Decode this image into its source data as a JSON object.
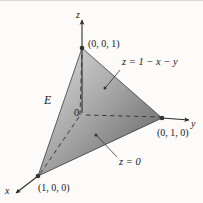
{
  "figure": {
    "kind": "3d-coordinate-diagram",
    "background_color": "#fcfbfa",
    "ink_color": "#1a1a1a"
  },
  "axes": [
    {
      "id": "z",
      "label": "z",
      "direction": "up"
    },
    {
      "id": "y",
      "label": "y",
      "direction": "right"
    },
    {
      "id": "x",
      "label": "x",
      "direction": "down-left"
    }
  ],
  "origin": {
    "label": "0"
  },
  "vertices": [
    {
      "id": "apex",
      "label": "(0, 0, 1)",
      "coords": [
        0,
        0,
        1
      ]
    },
    {
      "id": "right",
      "label": "(0, 1, 0)",
      "coords": [
        0,
        1,
        0
      ]
    },
    {
      "id": "front",
      "label": "(1, 0, 0)",
      "coords": [
        1,
        0,
        0
      ]
    }
  ],
  "annotations": [
    {
      "id": "region",
      "label": "E",
      "kind": "region-name"
    },
    {
      "id": "slant-plane",
      "label": "z = 1 − x − y",
      "kind": "surface-equation",
      "has_leader": true
    },
    {
      "id": "base-plane",
      "label": "z = 0",
      "kind": "surface-equation",
      "has_leader": true
    }
  ],
  "shading": {
    "front_face_light": "#d2d2d2",
    "front_face_dark": "#6e6e6e",
    "left_face_light": "#cfcfcf",
    "left_face_dark": "#9a9a9a",
    "base_face_light": "#b5b5b5",
    "base_face_dark": "#5f5f5f"
  }
}
